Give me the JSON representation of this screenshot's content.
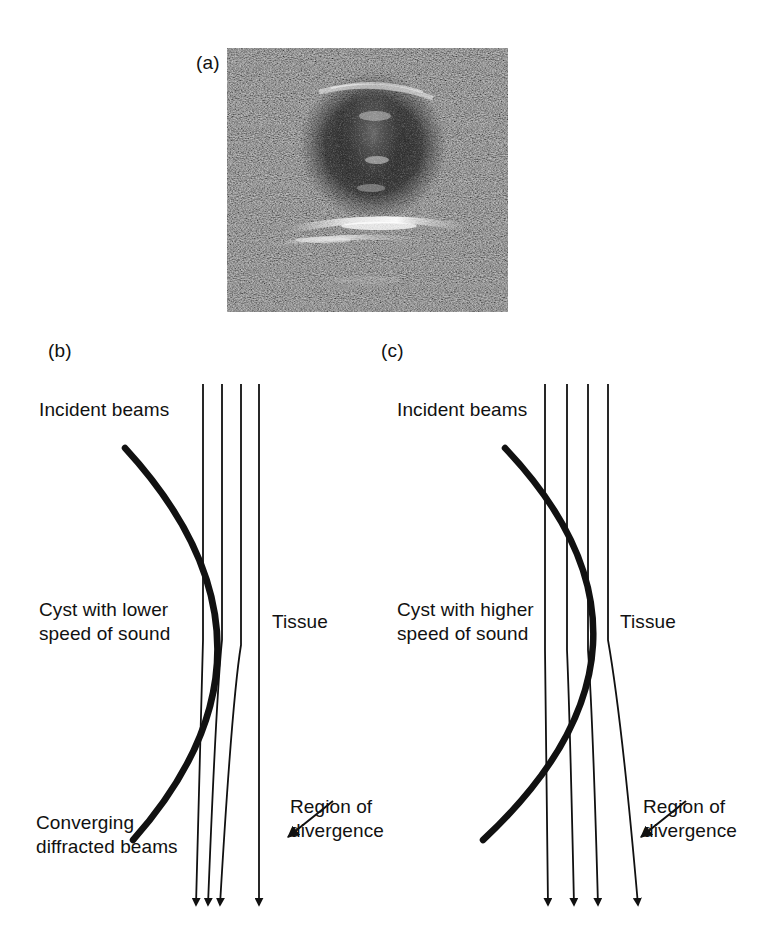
{
  "figure": {
    "background_color": "#ffffff",
    "ink_color": "#111111",
    "panels": [
      {
        "id": "a",
        "label": "(a)",
        "type": "ultrasound-image",
        "description": "B-mode ultrasound grayscale speckle image of a cyst",
        "image": {
          "name": "ultrasound-cyst-image",
          "x": 227,
          "y": 48,
          "width": 281,
          "height": 264,
          "base_color": "#2b2b2b",
          "speckle_light": "#b9b9b9",
          "speckle_dark": "#0d0d0d",
          "features": [
            "dark round cyst region in upper middle",
            "bright echo band below cyst",
            "bright specular streak at mid-lower left"
          ]
        }
      },
      {
        "id": "b",
        "label": "(b)",
        "title_lines": "Cyst with lower\nspeed of sound",
        "texts": {
          "incident_beams": "Incident beams",
          "cyst": "Cyst with lower\nspeed of sound",
          "tissue": "Tissue",
          "converging": "Converging\ndiffracted beams",
          "region": "Region of\ndivergence"
        },
        "beams": {
          "count": 4,
          "top_y": 384,
          "bottom_y": 915,
          "top_x": [
            203,
            222,
            241,
            259
          ],
          "bottom_x": [
            196,
            208,
            220,
            263
          ],
          "behavior": "converging"
        },
        "cyst_boundary": {
          "name": "cyst-boundary-curve",
          "stroke_width": 6,
          "start": [
            125,
            448
          ],
          "control": [
            300,
            640
          ],
          "end": [
            133,
            840
          ],
          "bulge": "right"
        },
        "pointer_arrow": {
          "from": [
            333,
            800
          ],
          "to": [
            286,
            838
          ]
        }
      },
      {
        "id": "c",
        "label": "(c)",
        "title_lines": "Cyst with higher\nspeed of sound",
        "texts": {
          "incident_beams": "Incident beams",
          "cyst": "Cyst with higher\nspeed of sound",
          "tissue": "Tissue",
          "region": "Region of\ndivergence"
        },
        "beams": {
          "count": 4,
          "top_y": 384,
          "bottom_y": 915,
          "top_x": [
            545,
            567,
            588,
            608
          ],
          "bottom_x": [
            548,
            574,
            598,
            638
          ],
          "behavior": "diverging"
        },
        "cyst_boundary": {
          "name": "cyst-boundary-curve",
          "stroke_width": 6,
          "start": [
            505,
            448
          ],
          "control": [
            690,
            640
          ],
          "end": [
            483,
            840
          ],
          "bulge": "right"
        },
        "pointer_arrow": {
          "from": [
            686,
            800
          ],
          "to": [
            639,
            838
          ]
        }
      }
    ]
  }
}
